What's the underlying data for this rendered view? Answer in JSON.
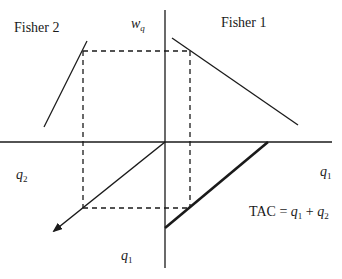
{
  "labels": {
    "fisher2": "Fisher 2",
    "fisher1": "Fisher 1",
    "wq_var": "w",
    "wq_sub": "q",
    "q2_left_var": "q",
    "q2_left_sub": "2",
    "q1_right_var": "q",
    "q1_right_sub": "1",
    "q1_bottom_var": "q",
    "q1_bottom_sub": "1",
    "tac_prefix": "TAC = ",
    "tac_q1_var": "q",
    "tac_q1_sub": "1",
    "tac_plus": " + ",
    "tac_q2_var": "q",
    "tac_q2_sub": "2"
  },
  "geometry": {
    "origin": [
      165,
      142
    ],
    "vertical_axis": {
      "x": 165,
      "y1": 10,
      "y2": 268
    },
    "horizontal_axis": {
      "y": 142,
      "x1": 0,
      "x2": 332
    },
    "dashed_rect": {
      "left": 83,
      "top": 51,
      "right": 190,
      "bottom": 208
    },
    "fisher1_line": [
      [
        172,
        38
      ],
      [
        298,
        125
      ]
    ],
    "fisher2_line": [
      [
        44,
        127
      ],
      [
        87,
        41
      ]
    ],
    "arrow_45deg": [
      [
        165,
        142
      ],
      [
        52,
        232
      ]
    ],
    "tac_line": [
      [
        165,
        228
      ],
      [
        268,
        142
      ]
    ]
  },
  "colors": {
    "line": "#1a1a1a",
    "background": "#ffffff"
  }
}
